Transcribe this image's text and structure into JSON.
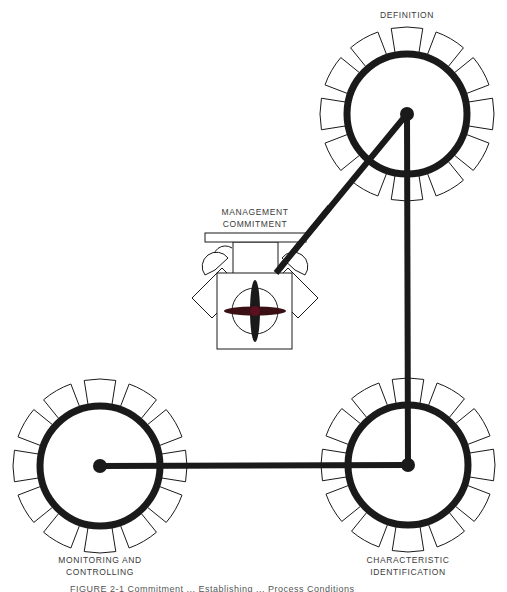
{
  "labels": {
    "definition": "DEFINITION",
    "management_line1": "MANAGEMENT",
    "management_line2": "COMMITMENT",
    "monitoring_line1": "MONITORING AND",
    "monitoring_line2": "CONTROLLING",
    "characteristic_line1": "CHARACTERISTIC",
    "characteristic_line2": "IDENTIFICATION"
  },
  "caption": "FIGURE 2-1 Commitment ... Establishing ... Process Conditions",
  "gears": [
    {
      "id": "definition",
      "cx": 407,
      "cy": 114,
      "r": 60,
      "teeth": 12
    },
    {
      "id": "characteristic-identification",
      "cx": 408,
      "cy": 465,
      "r": 60,
      "teeth": 12
    },
    {
      "id": "monitoring-controlling",
      "cx": 100,
      "cy": 466,
      "r": 60,
      "teeth": 12
    }
  ],
  "connections": [
    {
      "from": "definition",
      "to": "characteristic-identification"
    },
    {
      "from": "characteristic-identification",
      "to": "monitoring-controlling"
    },
    {
      "from": "definition",
      "to": "management-commitment-engine"
    }
  ],
  "colors": {
    "ink": "#1a1a1a",
    "label": "#3a3a3a",
    "hub_accent": "#5a1020"
  }
}
